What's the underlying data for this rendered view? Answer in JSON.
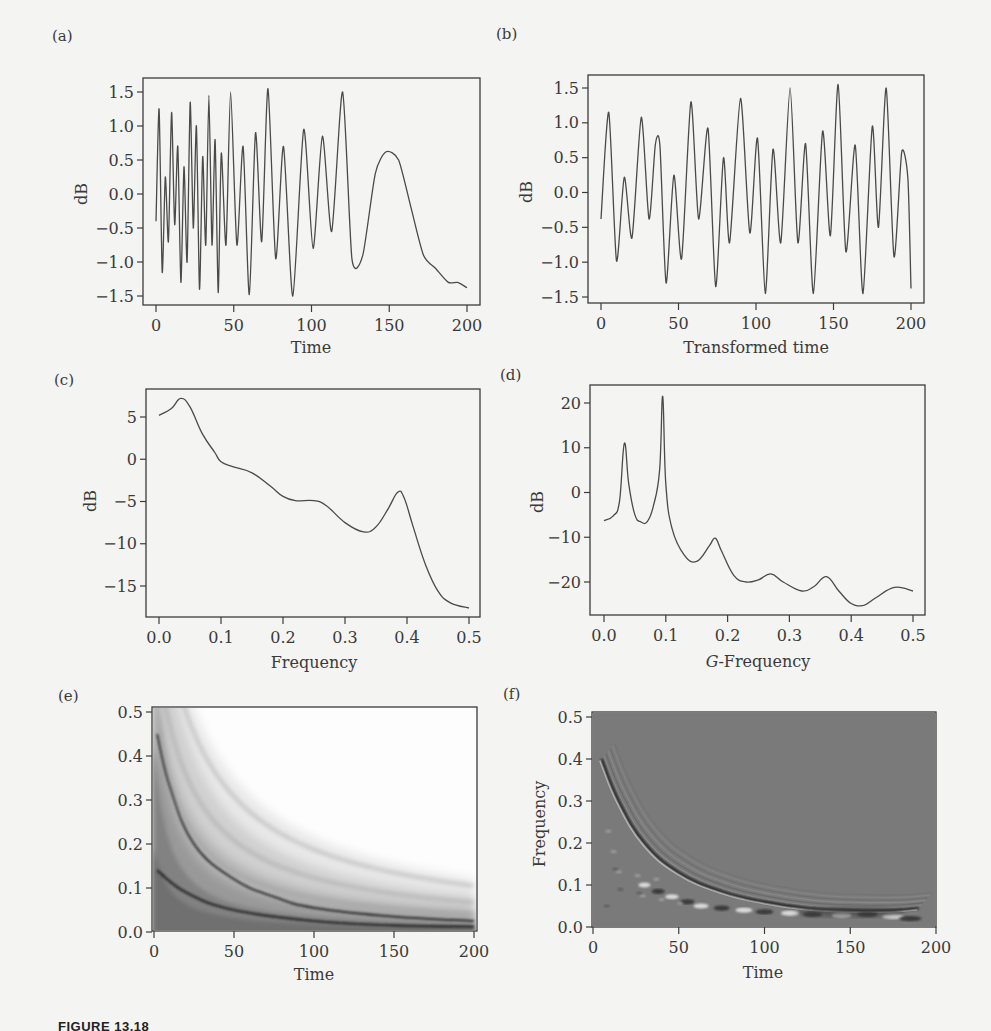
{
  "figure": {
    "caption": "FIGURE 13.18"
  },
  "panels": {
    "a": {
      "tag": "(a)",
      "ylabel": "dB",
      "xlabel": "Time",
      "yticks": [
        "1.5",
        "1.0",
        "0.5",
        "0.0",
        "−0.5",
        "−1.0",
        "−1.5"
      ],
      "xticks": [
        "0",
        "50",
        "100",
        "150",
        "200"
      ]
    },
    "b": {
      "tag": "(b)",
      "ylabel": "dB",
      "xlabel": "Transformed time",
      "yticks": [
        "1.5",
        "1.0",
        "0.5",
        "0.0",
        "−0.5",
        "−1.0",
        "−1.5"
      ],
      "xticks": [
        "0",
        "50",
        "100",
        "150",
        "200"
      ]
    },
    "c": {
      "tag": "(c)",
      "ylabel": "dB",
      "xlabel": "Frequency",
      "yticks": [
        "5",
        "0",
        "−5",
        "−10",
        "−15"
      ],
      "xticks": [
        "0.0",
        "0.1",
        "0.2",
        "0.3",
        "0.4",
        "0.5"
      ]
    },
    "d": {
      "tag": "(d)",
      "ylabel": "dB",
      "xlabel_italic": "G",
      "xlabel_rest": "-Frequency",
      "yticks": [
        "20",
        "10",
        "0",
        "−10",
        "−20"
      ],
      "xticks": [
        "0.0",
        "0.1",
        "0.2",
        "0.3",
        "0.4",
        "0.5"
      ]
    },
    "e": {
      "tag": "(e)",
      "ylabel": "",
      "xlabel": "Time",
      "yticks": [
        "0.5",
        "0.4",
        "0.3",
        "0.2",
        "0.1",
        "0.0"
      ],
      "xticks": [
        "0",
        "50",
        "100",
        "150",
        "200"
      ]
    },
    "f": {
      "tag": "(f)",
      "ylabel": "Frequency",
      "xlabel": "Time",
      "yticks": [
        "0.5",
        "0.4",
        "0.3",
        "0.2",
        "0.1",
        "0.0"
      ],
      "xticks": [
        "0",
        "50",
        "100",
        "150",
        "200"
      ]
    }
  },
  "colors": {
    "line": "#4a4a4a",
    "frame": "#3c3c3c",
    "f_background": "#7a7a7a"
  },
  "chart_data": [
    {
      "id": "a",
      "type": "line",
      "title": "(a)",
      "xlabel": "Time",
      "ylabel": "dB",
      "xlim": [
        0,
        200
      ],
      "ylim": [
        -1.6,
        1.6
      ],
      "description": "Chirp-like signal: oscillations that lengthen in period over time (frequency decreasing)",
      "x": [
        0,
        2,
        4,
        6,
        8,
        10,
        12,
        14,
        16,
        18,
        20,
        22,
        24,
        26,
        28,
        30,
        32,
        34,
        36,
        38,
        40,
        42,
        45,
        48,
        52,
        56,
        60,
        64,
        68,
        72,
        77,
        82,
        88,
        95,
        101,
        107,
        113,
        120,
        126,
        133,
        141,
        148,
        156,
        164,
        172,
        180,
        188,
        194,
        200
      ],
      "y": [
        -0.4,
        1.25,
        -1.15,
        0.25,
        -0.7,
        1.2,
        -0.45,
        0.7,
        -1.3,
        0.4,
        -1.0,
        1.35,
        -0.5,
        1.0,
        -1.4,
        0.55,
        -0.75,
        1.45,
        -0.75,
        0.8,
        -1.45,
        0.6,
        -0.75,
        1.5,
        -0.75,
        0.7,
        -1.48,
        0.9,
        -0.7,
        1.55,
        -0.95,
        0.7,
        -1.5,
        0.95,
        -0.8,
        0.85,
        -0.55,
        1.5,
        -0.95,
        -0.9,
        0.3,
        0.62,
        0.5,
        -0.2,
        -0.9,
        -1.1,
        -1.3,
        -1.3,
        -1.38
      ]
    },
    {
      "id": "b",
      "type": "line",
      "title": "(b)",
      "xlabel": "Transformed time",
      "ylabel": "dB",
      "xlim": [
        0,
        200
      ],
      "ylim": [
        -1.6,
        1.6
      ],
      "description": "Signal after time transformation: near-stationary oscillation",
      "x": [
        0,
        5,
        10,
        15,
        20,
        26,
        31,
        35,
        38,
        42,
        47,
        52,
        58,
        63,
        69,
        74,
        79,
        83,
        90,
        96,
        101,
        106,
        111,
        116,
        122,
        127,
        132,
        137,
        143,
        148,
        153,
        158,
        164,
        169,
        175,
        179,
        184,
        189,
        194,
        198,
        200
      ],
      "y": [
        -0.38,
        1.15,
        -0.98,
        0.22,
        -0.65,
        1.08,
        -0.38,
        0.68,
        0.68,
        -1.3,
        0.25,
        -0.95,
        1.3,
        -0.38,
        0.92,
        -1.35,
        0.5,
        -0.72,
        1.35,
        -0.58,
        0.78,
        -1.45,
        0.62,
        -0.72,
        1.5,
        -0.72,
        0.7,
        -1.45,
        0.88,
        -0.62,
        1.55,
        -0.85,
        0.68,
        -1.45,
        0.95,
        -0.5,
        1.5,
        -0.92,
        0.58,
        0.2,
        -1.38
      ]
    },
    {
      "id": "c",
      "type": "line",
      "title": "(c)",
      "xlabel": "Frequency",
      "ylabel": "dB",
      "xlim": [
        0,
        0.5
      ],
      "ylim": [
        -18,
        7.5
      ],
      "description": "Spectral density of original signal",
      "x": [
        0.0,
        0.02,
        0.035,
        0.05,
        0.07,
        0.09,
        0.1,
        0.12,
        0.15,
        0.18,
        0.2,
        0.22,
        0.25,
        0.27,
        0.3,
        0.33,
        0.35,
        0.37,
        0.385,
        0.395,
        0.41,
        0.43,
        0.45,
        0.47,
        0.5
      ],
      "y": [
        5.2,
        6.0,
        7.2,
        6.2,
        3.0,
        0.8,
        -0.3,
        -0.9,
        -1.6,
        -3.2,
        -4.4,
        -4.9,
        -4.9,
        -5.5,
        -7.5,
        -8.6,
        -8.0,
        -5.8,
        -3.9,
        -4.5,
        -8.0,
        -12.5,
        -15.6,
        -17.0,
        -17.6
      ]
    },
    {
      "id": "d",
      "type": "line",
      "title": "(d)",
      "xlabel": "G-Frequency",
      "ylabel": "dB",
      "xlim": [
        0,
        0.5
      ],
      "ylim": [
        -27,
        22
      ],
      "description": "G-spectral density of transformed signal",
      "x": [
        0.0,
        0.015,
        0.025,
        0.033,
        0.04,
        0.05,
        0.06,
        0.07,
        0.08,
        0.09,
        0.095,
        0.1,
        0.11,
        0.13,
        0.15,
        0.17,
        0.18,
        0.19,
        0.21,
        0.23,
        0.25,
        0.27,
        0.29,
        0.32,
        0.34,
        0.36,
        0.38,
        0.4,
        0.42,
        0.44,
        0.47,
        0.5
      ],
      "y": [
        -6.3,
        -5.2,
        -2,
        11,
        2,
        -5,
        -6.6,
        -6.5,
        -3,
        5,
        21.5,
        2,
        -8,
        -14,
        -15.4,
        -12,
        -10.2,
        -13,
        -18.5,
        -20,
        -19.5,
        -18.2,
        -20,
        -22,
        -21,
        -18.8,
        -22,
        -24.8,
        -25.2,
        -23.5,
        -21.2,
        -22
      ]
    },
    {
      "id": "e",
      "type": "heatmap",
      "title": "(e)",
      "xlabel": "Time",
      "ylabel": "",
      "xlim": [
        0,
        200
      ],
      "ylim": [
        0,
        0.5
      ],
      "description": "Time-frequency (Wigner-Ville-like) distribution of the original signal: dark curved ridges with frequency decreasing hyperbolically over time, shaded gray below and white above",
      "ridges": [
        {
          "x": [
            2,
            10,
            25,
            50,
            75,
            100,
            150,
            200
          ],
          "y": [
            0.45,
            0.33,
            0.2,
            0.12,
            0.08,
            0.055,
            0.035,
            0.025
          ]
        },
        {
          "x": [
            2,
            20,
            50,
            100,
            150,
            200
          ],
          "y": [
            0.14,
            0.09,
            0.05,
            0.025,
            0.015,
            0.012
          ]
        }
      ]
    },
    {
      "id": "f",
      "type": "heatmap",
      "title": "(f)",
      "xlabel": "Time",
      "ylabel": "Frequency",
      "xlim": [
        0,
        200
      ],
      "ylim": [
        0,
        0.5
      ],
      "description": "Time-frequency distribution of the G-transformed signal on a mid-gray background: a dark/white curved ridge descending from ~0.4 at t≈5 to ~0.04 at t≈160, with interference fringes below",
      "ridges": [
        {
          "x": [
            5,
            15,
            30,
            50,
            75,
            100,
            125,
            150,
            175,
            190
          ],
          "y": [
            0.4,
            0.3,
            0.2,
            0.13,
            0.085,
            0.06,
            0.045,
            0.04,
            0.04,
            0.045
          ]
        }
      ]
    }
  ]
}
